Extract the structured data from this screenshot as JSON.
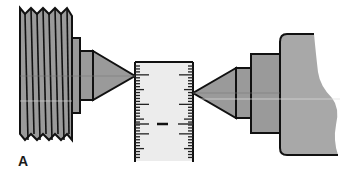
{
  "figure": {
    "label": "A",
    "colors": {
      "part_fill": "#9a9a9a",
      "body_fill": "#a6a6a6",
      "outline": "#111111",
      "scale_fill": "#ececec",
      "center_line": "#cfcfcf"
    },
    "components": [
      {
        "name": "threaded-spindle-nose"
      },
      {
        "name": "collar"
      },
      {
        "name": "headstock-center"
      },
      {
        "name": "scale"
      },
      {
        "name": "tailstock-center"
      },
      {
        "name": "tailstock-quill"
      },
      {
        "name": "tailstock-body"
      }
    ]
  }
}
